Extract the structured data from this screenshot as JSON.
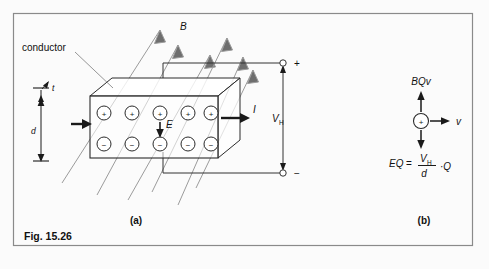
{
  "figure": {
    "caption": "Fig. 15.26",
    "border_color": "#8a8a8a",
    "background": "#fbfbfb",
    "ink_color": "#1a1a1a",
    "field_line_color": "#9a9a9a"
  },
  "panel_a": {
    "label": "(a)",
    "conductor_label": "conductor",
    "thickness_label": "t",
    "depth_label": "d",
    "field_label": "B",
    "efield_label": "E",
    "current_label": "I",
    "hall_voltage_label": "V",
    "hall_voltage_sub": "H",
    "terminal_plus": "+",
    "terminal_minus": "−",
    "positive_charges": [
      "+",
      "+",
      "+",
      "+",
      "+"
    ],
    "negative_charges": [
      "−",
      "−",
      "−",
      "−",
      "−"
    ],
    "field_line_count": 6
  },
  "panel_b": {
    "label": "(b)",
    "force_label": "BQv",
    "velocity_label": "v",
    "charge_sign": "+",
    "equation": {
      "lhs": "EQ",
      "equals": "=",
      "numerator": "V",
      "numerator_sub": "H",
      "denominator": "d",
      "factor": "·Q"
    }
  }
}
